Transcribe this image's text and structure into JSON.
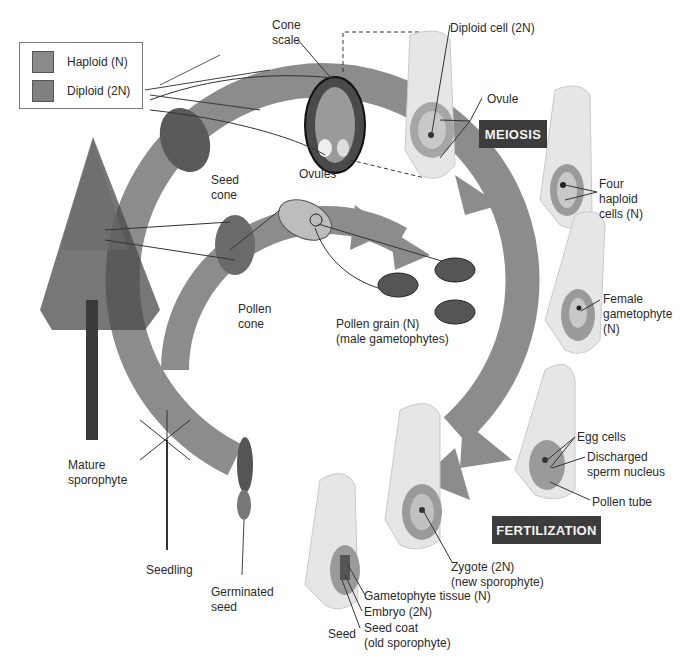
{
  "legend": {
    "items": [
      {
        "label": "Haploid (N)",
        "color": "#8a8a8a"
      },
      {
        "label": "Diploid (2N)",
        "color": "#808080"
      }
    ]
  },
  "stages": {
    "meiosis": "MEIOSIS",
    "fertilization": "FERTILIZATION"
  },
  "labels": {
    "cone_scale_1": "Cone",
    "cone_scale_2": "scale",
    "ovules": "Ovules",
    "diploid_cell": "Diploid cell (2N)",
    "ovule": "Ovule",
    "seed_cone_1": "Seed",
    "seed_cone_2": "cone",
    "four_haploid_1": "Four",
    "four_haploid_2": "haploid",
    "four_haploid_3": "cells (N)",
    "female_gam_1": "Female",
    "female_gam_2": "gametophyte",
    "female_gam_3": "(N)",
    "pollen_cone_1": "Pollen",
    "pollen_cone_2": "cone",
    "pollen_grain_1": "Pollen grain (N)",
    "pollen_grain_2": "(male gametophytes)",
    "egg_cells": "Egg cells",
    "discharged_1": "Discharged",
    "discharged_2": "sperm nucleus",
    "pollen_tube": "Pollen tube",
    "mature_1": "Mature",
    "mature_2": "sporophyte",
    "seedling": "Seedling",
    "germinated_1": "Germinated",
    "germinated_2": "seed",
    "zygote_1": "Zygote (2N)",
    "zygote_2": "(new sporophyte)",
    "gametophyte_tissue": "Gametophyte tissue (N)",
    "embryo": "Embryo (2N)",
    "seed_coat_1": "Seed coat",
    "seed_coat_2": "(old sporophyte)",
    "seed": "Seed"
  },
  "colors": {
    "cycle_arrow": "#8c8c8c",
    "stage_box": "#3c3c3c"
  }
}
